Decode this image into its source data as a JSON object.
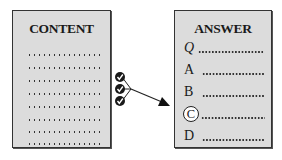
{
  "content_panel": {
    "title": "CONTENT",
    "dotted_line_count": 8
  },
  "answer_panel": {
    "title": "ANSWER",
    "rows": [
      {
        "label": "Q",
        "circled": false
      },
      {
        "label": "A",
        "circled": false
      },
      {
        "label": "B",
        "circled": false
      },
      {
        "label": "C",
        "circled": true
      },
      {
        "label": "D",
        "circled": false
      }
    ]
  },
  "connector": {
    "check_icons": [
      "checkmark-icon",
      "checkmark-icon",
      "checkmark-icon"
    ],
    "arrow_target": "C"
  },
  "colors": {
    "panel_fill": "#dcdcdc",
    "ink": "#1a1a1a"
  }
}
